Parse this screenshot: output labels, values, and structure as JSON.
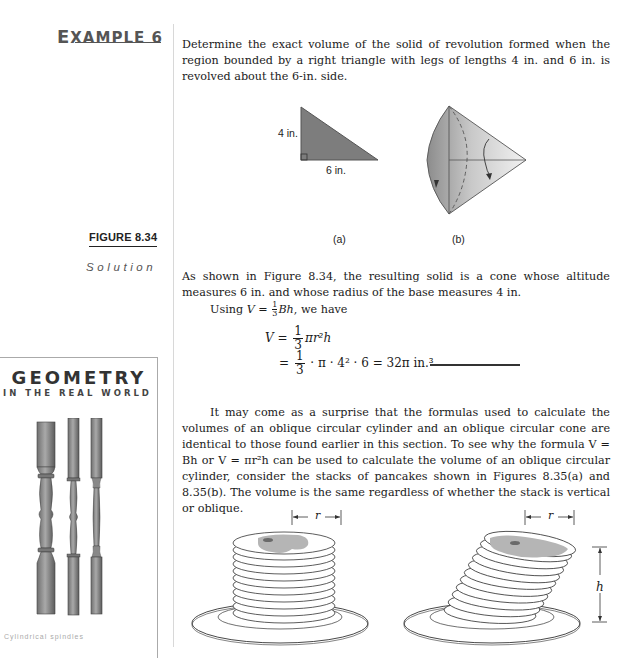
{
  "margin": {
    "example_label_prefix": "E",
    "example_label_rest": "XAMPLE 6",
    "figure_label": "FIGURE 8.34",
    "solution_label": "Solution",
    "sidebar": {
      "title": "GEOMETRY",
      "subtitle": "IN THE REAL WORLD",
      "image": "three turned wooden balusters (stair spindles)",
      "caption_faint": "Cylindrical spindles"
    }
  },
  "example": {
    "problem_text": "Determine the exact volume of the solid of revolution formed when the region bounded by a right triangle with legs of lengths 4 in. and 6 in. is revolved about the 6-in. side."
  },
  "figure_834": {
    "a": {
      "label": "(a)",
      "leg_vertical": "4 in.",
      "leg_horizontal": "6 in."
    },
    "b": {
      "label": "(b)",
      "description": "cone with rotation arrows"
    }
  },
  "solution": {
    "text_1": "As shown in Figure 8.34, the resulting solid is a cone whose altitude measures 6 in. and whose radius of the base measures 4 in.",
    "using_prefix": "Using",
    "using_V": "V",
    "using_eq": " = ",
    "frac_num": "1",
    "frac_den": "3",
    "using_Bh": "Bh",
    "using_suffix": ", we have",
    "eq1_lhs": "V",
    "eq1_eq": " = ",
    "eq1_num": "1",
    "eq1_den": "3",
    "eq1_rhs": "πr²h",
    "eq2_eq": "= ",
    "eq2_num": "1",
    "eq2_den": "3",
    "eq2_rhs": "· π · 4² · 6 = 32π in.³"
  },
  "discussion": {
    "text": "It may come as a surprise that the formulas used to calculate the volumes of an oblique circular cylinder and an oblique circular cone are identical to those found earlier in this section. To see why the formula V = Bh or V = πr²h can be used to calculate the volume of an oblique circular cylinder, consider the stacks of pancakes shown in Figures 8.35(a) and 8.35(b). The volume is the same regardless of whether the stack is vertical or oblique."
  },
  "figure_835": {
    "a": {
      "dimension_label": "r",
      "description": "vertical stack of pancakes on a plate"
    },
    "b": {
      "dimension_label_r": "r",
      "dimension_label_h": "h",
      "description": "oblique stack of pancakes on a plate"
    }
  }
}
